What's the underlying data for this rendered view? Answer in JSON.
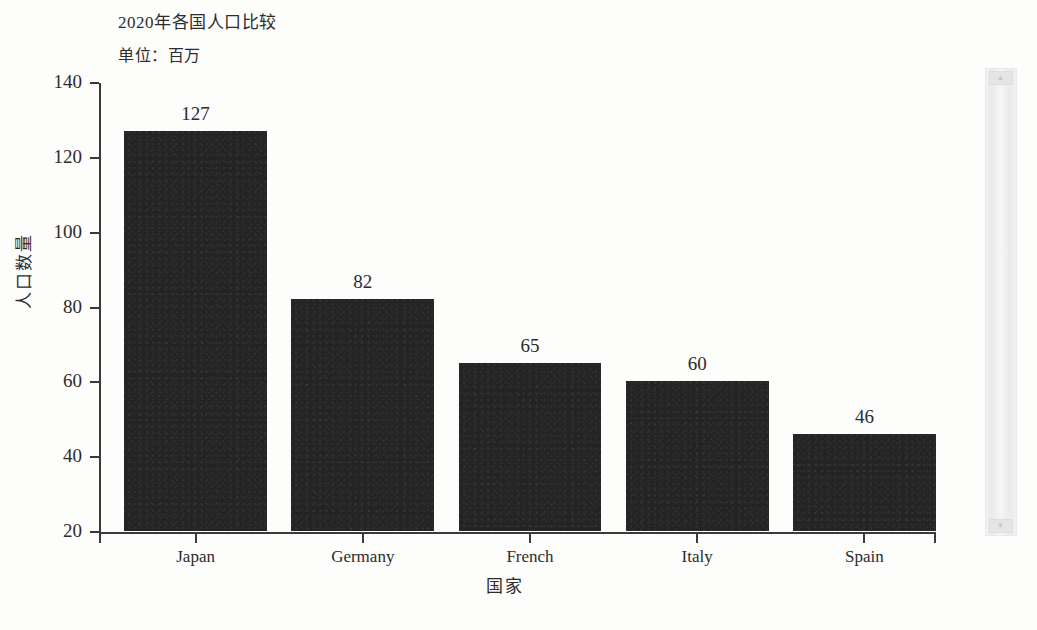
{
  "chart_data": {
    "type": "bar",
    "title": "2020年各国人口比较",
    "subtitle": "单位：百万",
    "xlabel": "国家",
    "ylabel": "人口数量",
    "categories": [
      "Japan",
      "Germany",
      "French",
      "Italy",
      "Spain"
    ],
    "values": [
      127,
      82,
      65,
      60,
      46
    ],
    "value_labels": [
      "127",
      "82",
      "65",
      "60",
      "46"
    ],
    "ylim": [
      20,
      140
    ],
    "ytick_labels": [
      "140",
      "120",
      "100",
      "80",
      "60",
      "40",
      "20"
    ],
    "ytick_values": [
      140,
      120,
      100,
      80,
      60,
      40,
      20
    ],
    "grid": false,
    "legend": false,
    "bar_color": "#242424",
    "axis_color": "#3a3a3a",
    "text_color": "#2c2c2c",
    "background_color": "#fdfdfc"
  },
  "artifact": {
    "top_cap": "▲",
    "bottom_cap": "▼"
  }
}
